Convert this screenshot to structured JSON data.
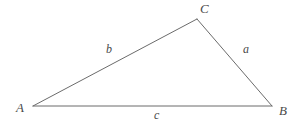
{
  "figure": {
    "type": "geometry-diagram",
    "shape": "triangle",
    "background_color": "#ffffff",
    "stroke_color": "#6b6b6b",
    "label_color": "#4a4a4a",
    "stroke_width": 1,
    "canvas": {
      "width": 303,
      "height": 127
    },
    "vertices": [
      {
        "id": "A",
        "label": "A",
        "x": 33,
        "y": 106
      },
      {
        "id": "B",
        "label": "B",
        "x": 272,
        "y": 106
      },
      {
        "id": "C",
        "label": "C",
        "x": 197,
        "y": 19
      }
    ],
    "sides": [
      {
        "id": "a",
        "label": "a",
        "from": "C",
        "to": "B",
        "label_x": 247,
        "label_y": 49
      },
      {
        "id": "b",
        "label": "b",
        "from": "A",
        "to": "C",
        "label_x": 110,
        "label_y": 48
      },
      {
        "id": "c",
        "label": "c",
        "from": "A",
        "to": "B",
        "label_x": 158,
        "label_y": 115
      }
    ],
    "path": "M 33 106 L 197 19 L 272 106 Z"
  }
}
